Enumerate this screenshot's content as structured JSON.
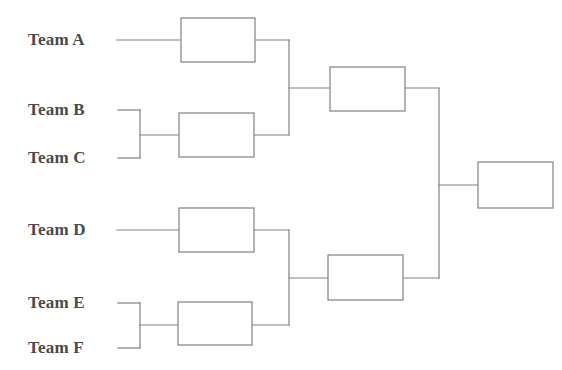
{
  "diagram": {
    "type": "bracket",
    "teams_count": 6,
    "rounds_count": 3,
    "colors": {
      "line": "#808080",
      "box_fill": "#ffffff",
      "text": "#4a4a4a",
      "background": "#ffffff"
    },
    "line_width": 1.2
  },
  "teams": [
    {
      "id": "team-a",
      "label": "Team A",
      "x": 28,
      "y": 40
    },
    {
      "id": "team-b",
      "label": "Team B",
      "x": 28,
      "y": 110
    },
    {
      "id": "team-c",
      "label": "Team C",
      "x": 28,
      "y": 158
    },
    {
      "id": "team-d",
      "label": "Team D",
      "x": 28,
      "y": 230
    },
    {
      "id": "team-e",
      "label": "Team E",
      "x": 28,
      "y": 303
    },
    {
      "id": "team-f",
      "label": "Team F",
      "x": 28,
      "y": 348
    }
  ],
  "boxes": [
    {
      "id": "box-round1-a",
      "round": 1,
      "label": "",
      "x": 181,
      "y": 18,
      "w": 74,
      "h": 44
    },
    {
      "id": "box-round1-bc",
      "round": 1,
      "label": "",
      "x": 179,
      "y": 113,
      "w": 75,
      "h": 44
    },
    {
      "id": "box-round1-d",
      "round": 1,
      "label": "",
      "x": 179,
      "y": 208,
      "w": 75,
      "h": 44
    },
    {
      "id": "box-round1-ef",
      "round": 1,
      "label": "",
      "x": 178,
      "y": 302,
      "w": 74,
      "h": 43
    },
    {
      "id": "box-semifinal-top",
      "round": 2,
      "label": "",
      "x": 330,
      "y": 67,
      "w": 75,
      "h": 44
    },
    {
      "id": "box-semifinal-bottom",
      "round": 2,
      "label": "",
      "x": 328,
      "y": 255,
      "w": 75,
      "h": 45
    },
    {
      "id": "box-final",
      "round": 3,
      "label": "",
      "x": 478,
      "y": 162,
      "w": 75,
      "h": 46
    }
  ],
  "connectors": [
    {
      "id": "line-team-a-to-box",
      "points": "117,40 181,40"
    },
    {
      "id": "line-team-b-to-merge",
      "points": "118,110 140,110"
    },
    {
      "id": "line-team-c-to-merge",
      "points": "118,158 140,158"
    },
    {
      "id": "line-merge-bc",
      "points": "140,110 140,158"
    },
    {
      "id": "line-merge-bc-to-box",
      "points": "140,135 179,135"
    },
    {
      "id": "line-team-d-to-box",
      "points": "117,230 179,230"
    },
    {
      "id": "line-team-e-to-merge",
      "points": "118,303 140,303"
    },
    {
      "id": "line-team-f-to-merge",
      "points": "118,348 140,348"
    },
    {
      "id": "line-merge-ef",
      "points": "140,303 140,348"
    },
    {
      "id": "line-merge-ef-to-box",
      "points": "140,325 178,325"
    },
    {
      "id": "line-box-a-out",
      "points": "255,40 289,40"
    },
    {
      "id": "line-box-bc-out",
      "points": "254,135 289,135"
    },
    {
      "id": "line-merge-semi-top",
      "points": "289,40 289,135"
    },
    {
      "id": "line-semi-top-in",
      "points": "289,88 330,88"
    },
    {
      "id": "line-box-d-out",
      "points": "254,230 289,230"
    },
    {
      "id": "line-box-ef-out",
      "points": "252,325 289,325"
    },
    {
      "id": "line-merge-semi-bot",
      "points": "289,230 289,325"
    },
    {
      "id": "line-semi-bot-in",
      "points": "289,278 328,278"
    },
    {
      "id": "line-semi-top-out",
      "points": "405,88 439,88"
    },
    {
      "id": "line-semi-bot-out",
      "points": "403,278 439,278"
    },
    {
      "id": "line-merge-final",
      "points": "439,88 439,278"
    },
    {
      "id": "line-final-in",
      "points": "439,185 478,185"
    }
  ]
}
